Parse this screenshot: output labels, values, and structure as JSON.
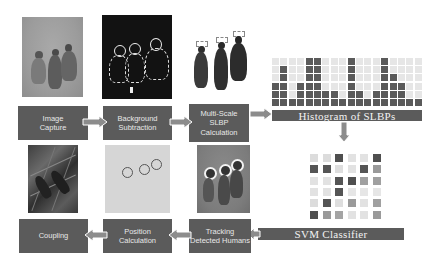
{
  "diagram": {
    "top_row": {
      "steps": [
        {
          "label": "Image\nCapture",
          "image": "image-capture-photo"
        },
        {
          "label": "Background\nSubtraction",
          "image": "background-subtraction-mask"
        },
        {
          "label": "Multi-Scale\nSLBP\nCalculation",
          "image": "multi-scale-slbp-silhouettes"
        }
      ],
      "histogram_label": "Histogram of SLBPs"
    },
    "histogram": {
      "columns": 18,
      "rows": 6,
      "column_heights": [
        3,
        5,
        1,
        3,
        6,
        6,
        2,
        2,
        1,
        6,
        2,
        1,
        2,
        6,
        4,
        3,
        1,
        1
      ],
      "dark_color": "#5a5a5a",
      "light_color": "#e6e6e6"
    },
    "svm": {
      "label": "SVM Classifier",
      "matrix": [
        [
          "#dcdcdc",
          "#dcdcdc",
          "#4f4f4f",
          "#e2e2e2",
          "#e2e2e2",
          "#4f4f4f"
        ],
        [
          "#555555",
          "#555555",
          "#dedede",
          "#e2e2e2",
          "#555555",
          "#9a9a9a"
        ],
        [
          "#e2e2e2",
          "#e2e2e2",
          "#555555",
          "#4f4f4f",
          "#a0a0a0",
          "#a0a0a0"
        ],
        [
          "#e2e2e2",
          "#e2e2e2",
          "#555555",
          "#e6e6e6",
          "#e6e6e6",
          "#e6e6e6"
        ],
        [
          "#dcdcdc",
          "#555555",
          "#dedede",
          "#9a9a9a",
          "#e2e2e2",
          "#a0a0a0"
        ],
        [
          "#4f4f4f",
          "#9a9a9a",
          "#a4a4a4",
          "#e2e2e2",
          "#e2e2e2",
          "#9a9a9a"
        ]
      ]
    },
    "bottom_row": {
      "steps": [
        {
          "label": "Coupling",
          "image": "coupling-photo"
        },
        {
          "label": "Position\nCalculation",
          "image": "position-circles"
        },
        {
          "label": "Tracking\nDetected Humans",
          "image": "tracking-photo"
        }
      ]
    },
    "colors": {
      "box": "#5b5b5b",
      "box_text": "#e8e8e8",
      "arrow": "#8c8c8c"
    }
  }
}
